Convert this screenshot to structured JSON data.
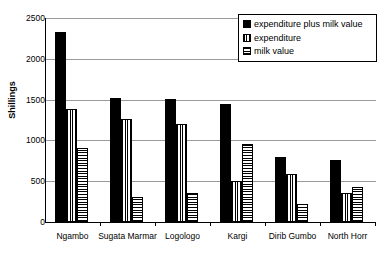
{
  "chart_data": {
    "type": "bar",
    "title": "",
    "xlabel": "",
    "ylabel": "Shillings",
    "ylim": [
      0,
      2500
    ],
    "ytick_step": 500,
    "yticks": [
      2500,
      2000,
      1500,
      1000,
      500,
      0
    ],
    "ytick_labels": [
      "2500",
      "2000",
      "1500",
      "1000",
      "500",
      "0"
    ],
    "grid": true,
    "grid_axis": "y",
    "legend_position": "top-right",
    "categories": [
      "Ngambo",
      "Sugata Marmar",
      "Logologo",
      "Kargi",
      "Dirib Gumbo",
      "North Horr"
    ],
    "series": [
      {
        "name": "expenditure plus milk value",
        "pattern": "solid-black",
        "color": "#000000",
        "values": [
          2330,
          1525,
          1510,
          1450,
          800,
          755
        ]
      },
      {
        "name": "expenditure",
        "pattern": "vertical-stripes",
        "color": "#000000",
        "values": [
          1390,
          1265,
          1200,
          505,
          585,
          355
        ]
      },
      {
        "name": "milk value",
        "pattern": "horizontal-stripes",
        "color": "#000000",
        "values": [
          910,
          310,
          350,
          950,
          225,
          425
        ]
      }
    ]
  },
  "legend": {
    "entries": [
      {
        "label": "expenditure plus milk value"
      },
      {
        "label": "expenditure"
      },
      {
        "label": "milk value"
      }
    ]
  }
}
